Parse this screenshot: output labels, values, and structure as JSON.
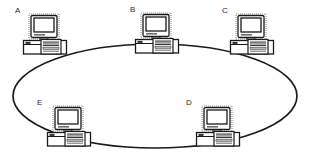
{
  "diagram": {
    "type": "ring-topology",
    "background_color": "#ffffff",
    "line_color": "#1a1a1a",
    "label_color": "#2b2b2b",
    "ring": {
      "shape": "ellipse",
      "center_x": 155,
      "center_y": 96,
      "radius_x": 142,
      "radius_y": 52,
      "stroke_width": 1.6
    },
    "nodes": [
      {
        "id": "A",
        "label": "A",
        "label_x": 15,
        "label_y": 7,
        "pc_x": 22,
        "pc_y": 13,
        "pc_w": 48,
        "pc_h": 44,
        "icon": "desktop-computer-icon"
      },
      {
        "id": "B",
        "label": "B",
        "label_x": 130,
        "label_y": 6,
        "pc_x": 134,
        "pc_y": 12,
        "pc_w": 48,
        "pc_h": 44,
        "icon": "desktop-computer-icon"
      },
      {
        "id": "C",
        "label": "C",
        "label_x": 222,
        "label_y": 7,
        "pc_x": 229,
        "pc_y": 13,
        "pc_w": 48,
        "pc_h": 44,
        "icon": "desktop-computer-icon"
      },
      {
        "id": "D",
        "label": "D",
        "label_x": 186,
        "label_y": 99,
        "pc_x": 195,
        "pc_y": 105,
        "pc_w": 48,
        "pc_h": 44,
        "icon": "desktop-computer-icon"
      },
      {
        "id": "E",
        "label": "E",
        "label_x": 37,
        "label_y": 99,
        "pc_x": 46,
        "pc_y": 105,
        "pc_w": 48,
        "pc_h": 44,
        "icon": "desktop-computer-icon"
      }
    ],
    "connections": [
      {
        "from": "A",
        "to": "B"
      },
      {
        "from": "B",
        "to": "C"
      },
      {
        "from": "C",
        "to": "D"
      },
      {
        "from": "D",
        "to": "E"
      },
      {
        "from": "E",
        "to": "A"
      }
    ]
  }
}
